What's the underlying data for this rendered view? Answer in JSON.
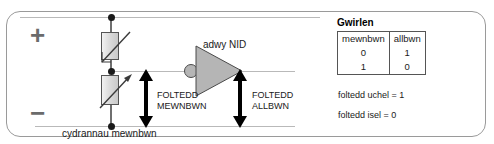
{
  "diagram": {
    "polarity": {
      "positive": "+",
      "negative": "−"
    },
    "gate": {
      "label": "adwy NID",
      "type": "not-gate"
    },
    "voltage_labels": {
      "input_line1": "FOLTEDD",
      "input_line2": "MEWNBWN",
      "output_line1": "FOLTEDD",
      "output_line2": "ALLBWN"
    },
    "caption": "cydrannau mewnbwn",
    "top_cut_text": " ",
    "components": [
      {
        "name": "ldr-resistor",
        "position": "top"
      },
      {
        "name": "variable-resistor",
        "position": "bottom"
      }
    ],
    "colors": {
      "rail": "#b9b9b9",
      "wire": "#6f6f6f",
      "node": "#1a1a1a",
      "gate_fill": "#b5b5b5",
      "panel_border": "#9a9a9a",
      "sign": "#6b6b6b",
      "arrow": "#000000"
    }
  },
  "truth_table": {
    "title": "Gwirlen",
    "headers": [
      "mewnbwn",
      "allbwn"
    ],
    "rows": [
      [
        "0",
        "1"
      ],
      [
        "1",
        "0"
      ]
    ]
  },
  "notes": {
    "high": "foltedd uchel = 1",
    "low": "foltedd isel = 0"
  }
}
